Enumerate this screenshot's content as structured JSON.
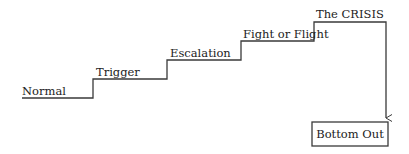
{
  "diagram": {
    "type": "staircase",
    "steps": [
      {
        "label": "Normal"
      },
      {
        "label": "Trigger"
      },
      {
        "label": "Escalation"
      },
      {
        "label": "Fight or Flight"
      },
      {
        "label": "The CRISIS"
      }
    ],
    "end_box": {
      "label": "Bottom Out"
    },
    "colors": {
      "line": "#3a3a3a",
      "text": "#222222",
      "background": "#ffffff"
    }
  }
}
